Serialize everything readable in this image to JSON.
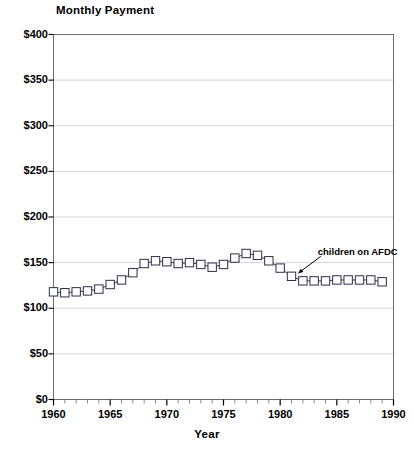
{
  "chart_data": {
    "type": "line",
    "title": "Monthly Payment",
    "xlabel": "Year",
    "ylabel": "",
    "xlim": [
      1960,
      1990
    ],
    "ylim": [
      0,
      400
    ],
    "grid": "horizontal",
    "legend": "none",
    "marker": "open-square",
    "ytick_labels": [
      "$0",
      "$50",
      "$100",
      "$150",
      "$200",
      "$250",
      "$300",
      "$350",
      "$400"
    ],
    "ytick_values": [
      0,
      50,
      100,
      150,
      200,
      250,
      300,
      350,
      400
    ],
    "xtick_labels": [
      "1960",
      "1965",
      "1970",
      "1975",
      "1980",
      "1985",
      "1990"
    ],
    "xtick_values": [
      1960,
      1965,
      1970,
      1975,
      1980,
      1985,
      1990
    ],
    "xtick_minor_step": 1,
    "annotations": [
      {
        "text": "children on AFDC",
        "x": 1984.2,
        "y": 158,
        "arrow_to_x": 1981.6,
        "arrow_to_y": 134
      }
    ],
    "series": [
      {
        "name": "children on AFDC",
        "x": [
          1960,
          1961,
          1962,
          1963,
          1964,
          1965,
          1966,
          1967,
          1968,
          1969,
          1970,
          1971,
          1972,
          1973,
          1974,
          1975,
          1976,
          1977,
          1978,
          1979,
          1980,
          1981,
          1982,
          1983,
          1984,
          1985,
          1986,
          1987,
          1988,
          1989
        ],
        "values": [
          118,
          117,
          118,
          119,
          121,
          126,
          131,
          139,
          149,
          152,
          151,
          149,
          150,
          148,
          145,
          148,
          155,
          160,
          158,
          152,
          144,
          135,
          130,
          130,
          130,
          131,
          131,
          131,
          131,
          129
        ]
      }
    ]
  }
}
